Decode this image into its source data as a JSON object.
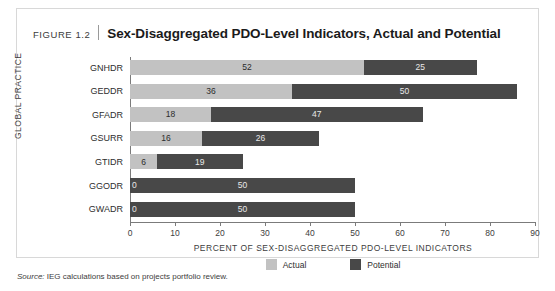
{
  "figure": {
    "number": "FIGURE 1.2",
    "title": "Sex-Disaggregated PDO-Level Indicators, Actual and Potential",
    "source_prefix": "Source:",
    "source_text": " IEG calculations based on projects portfolio review."
  },
  "legend": {
    "items": [
      {
        "label": "Actual",
        "color": "#c2c2c2"
      },
      {
        "label": "Potential",
        "color": "#484848"
      }
    ]
  },
  "colors": {
    "actual": "#c2c2c2",
    "potential": "#484848",
    "axis": "#7b7b7b",
    "card_border": "#d8d8d8"
  },
  "chart_data": {
    "type": "bar",
    "orientation": "horizontal",
    "stacked": true,
    "title": "Sex-Disaggregated PDO-Level Indicators, Actual and Potential",
    "xlabel": "PERCENT OF SEX-DISAGGREGATED PDO-LEVEL INDICATORS",
    "ylabel": "GLOBAL PRACTICE",
    "xlim": [
      0,
      90
    ],
    "xticks": [
      0,
      10,
      20,
      30,
      40,
      50,
      60,
      70,
      80,
      90
    ],
    "xtick_labels": [
      "0",
      "10",
      "20",
      "30",
      "40",
      "50",
      "60",
      "70",
      "80",
      "90"
    ],
    "grid": false,
    "legend_position": "bottom",
    "categories": [
      "GNHDR",
      "GEDDR",
      "GFADR",
      "GSURR",
      "GTIDR",
      "GGODR",
      "GWADR"
    ],
    "series": [
      {
        "name": "Actual",
        "values": [
          52,
          36,
          18,
          16,
          6,
          0,
          0
        ]
      },
      {
        "name": "Potential",
        "values": [
          25,
          50,
          47,
          26,
          19,
          50,
          50
        ]
      }
    ],
    "bar_labels": {
      "actual": [
        "52",
        "36",
        "18",
        "16",
        "6",
        "0",
        "0"
      ],
      "potential": [
        "25",
        "50",
        "47",
        "26",
        "19",
        "50",
        "50"
      ]
    },
    "totals": [
      77,
      86,
      65,
      42,
      25,
      50,
      50
    ]
  }
}
